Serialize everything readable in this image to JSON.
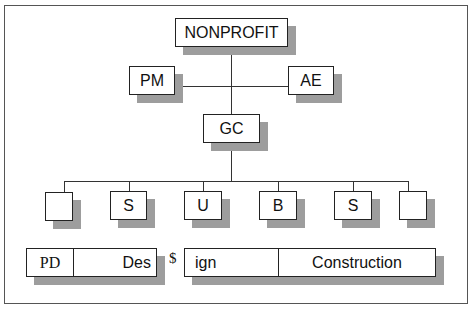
{
  "diagram": {
    "type": "org-chart",
    "root": {
      "label": "NONPROFIT"
    },
    "advisors": [
      {
        "label": "PM",
        "side": "left"
      },
      {
        "label": "AE",
        "side": "right"
      }
    ],
    "contractor": {
      "label": "GC"
    },
    "subcontractors": [
      {
        "label": ""
      },
      {
        "label": "S"
      },
      {
        "label": "U"
      },
      {
        "label": "B"
      },
      {
        "label": "S"
      },
      {
        "label": ""
      }
    ],
    "phases": {
      "bar1": [
        {
          "label": "PD"
        },
        {
          "label": "Des"
        }
      ],
      "separator": "$",
      "bar2": [
        {
          "label": "ign"
        },
        {
          "label": "Construction"
        }
      ]
    },
    "colors": {
      "line": "#333333",
      "shadow": "#9d9d9d",
      "box_fill": "#ffffff"
    }
  }
}
